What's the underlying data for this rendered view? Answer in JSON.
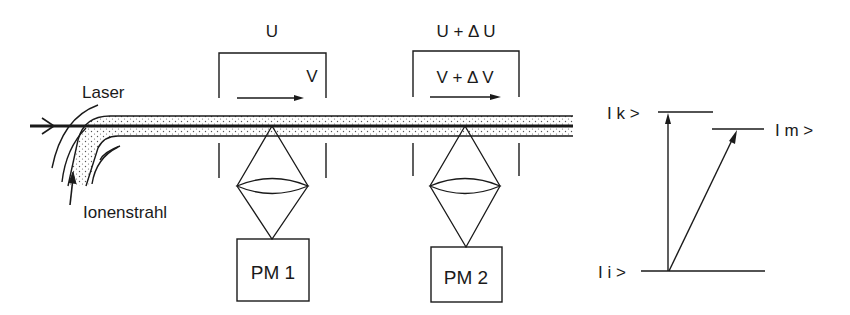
{
  "diagram": {
    "title": "",
    "labels": {
      "laser": "Laser",
      "ion_beam": "Ionenstrahl",
      "voltage_1": "U",
      "velocity_1": "V",
      "voltage_2": "U + Δ U",
      "velocity_2": "V + Δ V",
      "detector_1": "PM 1",
      "detector_2": "PM 2"
    },
    "energy_levels": {
      "upper_k": "I k >",
      "upper_m": "I m >",
      "lower_i": "I i >"
    },
    "colors": {
      "ink": "#1a1a1a",
      "dots": "#555555",
      "background": "#ffffff"
    }
  }
}
